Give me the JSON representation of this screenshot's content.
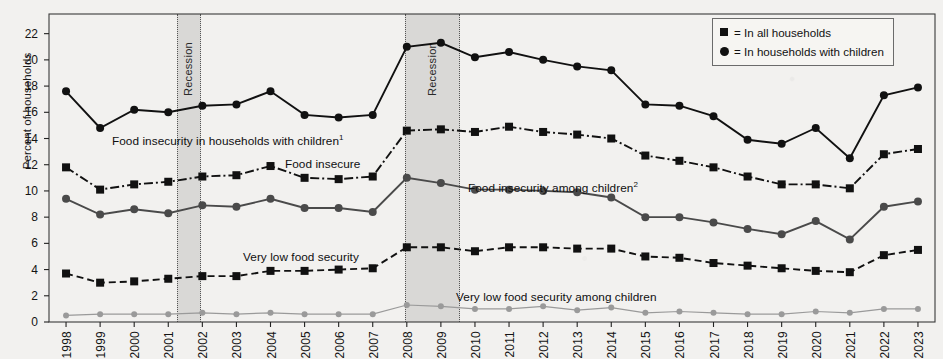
{
  "chart_data": {
    "type": "line",
    "title": "",
    "xlabel": "",
    "ylabel": "Percent of households",
    "ylim": [
      0,
      23.5
    ],
    "yticks": [
      0,
      2,
      4,
      6,
      8,
      10,
      12,
      14,
      16,
      18,
      20,
      22
    ],
    "grid": false,
    "legend_position": "top-right",
    "x": [
      1998,
      1999,
      2000,
      2001,
      2002,
      2003,
      2004,
      2005,
      2006,
      2007,
      2008,
      2009,
      2010,
      2011,
      2012,
      2013,
      2014,
      2015,
      2016,
      2017,
      2018,
      2019,
      2020,
      2021,
      2022,
      2023
    ],
    "xtick_labels": [
      "1998",
      "1999",
      "2000",
      "2001",
      "2002",
      "2003",
      "2004",
      "2005",
      "2006",
      "2007",
      "2008",
      "2009",
      "2010",
      "2011",
      "2012",
      "2013",
      "2014",
      "2015",
      "2016",
      "2017",
      "2018",
      "2019",
      "2020",
      "2021",
      "2022",
      "2023"
    ],
    "series": [
      {
        "name": "Food insecurity in households with children",
        "inline_label": "Food insecurity in households with children",
        "footnote": "1",
        "marker": "circle",
        "line_style": "solid",
        "color": "#111111",
        "values": [
          17.6,
          14.8,
          16.2,
          16.0,
          16.5,
          16.6,
          17.6,
          15.8,
          15.6,
          15.8,
          21.0,
          21.3,
          20.2,
          20.6,
          20.0,
          19.5,
          19.2,
          16.6,
          16.5,
          15.7,
          13.9,
          13.6,
          14.8,
          12.5,
          17.3,
          17.9
        ]
      },
      {
        "name": "Food insecure",
        "inline_label": "Food insecure",
        "footnote": "",
        "marker": "square",
        "line_style": "dash-dot",
        "color": "#111111",
        "values": [
          11.8,
          10.1,
          10.5,
          10.7,
          11.1,
          11.2,
          11.9,
          11.0,
          10.9,
          11.1,
          14.6,
          14.7,
          14.5,
          14.9,
          14.5,
          14.3,
          14.0,
          12.7,
          12.3,
          11.8,
          11.1,
          10.5,
          10.5,
          10.2,
          12.8,
          13.2
        ]
      },
      {
        "name": "Food insecurity among children",
        "inline_label": "Food insecurity among children",
        "footnote": "2",
        "marker": "circle",
        "line_style": "solid",
        "color": "#4a4a4a",
        "values": [
          9.4,
          8.2,
          8.6,
          8.3,
          8.9,
          8.8,
          9.4,
          8.7,
          8.7,
          8.4,
          11.0,
          10.6,
          10.1,
          10.1,
          10.0,
          9.9,
          9.5,
          8.0,
          8.0,
          7.6,
          7.1,
          6.7,
          7.7,
          6.3,
          8.8,
          9.2
        ]
      },
      {
        "name": "Very low food security",
        "inline_label": "Very low food security",
        "footnote": "",
        "marker": "square",
        "line_style": "dashed",
        "color": "#111111",
        "values": [
          3.7,
          3.0,
          3.1,
          3.3,
          3.5,
          3.5,
          3.9,
          3.9,
          4.0,
          4.1,
          5.7,
          5.7,
          5.4,
          5.7,
          5.7,
          5.6,
          5.6,
          5.0,
          4.9,
          4.5,
          4.3,
          4.1,
          3.9,
          3.8,
          5.1,
          5.5
        ]
      },
      {
        "name": "Very low food security among children",
        "inline_label": "Very low food security among children",
        "footnote": "",
        "marker": "circle",
        "line_style": "solid",
        "color": "#9a9a9a",
        "values": [
          0.5,
          0.6,
          0.6,
          0.6,
          0.7,
          0.6,
          0.7,
          0.6,
          0.6,
          0.6,
          1.3,
          1.2,
          1.0,
          1.0,
          1.2,
          0.9,
          1.1,
          0.7,
          0.8,
          0.7,
          0.6,
          0.6,
          0.8,
          0.7,
          1.0,
          1.0
        ]
      }
    ],
    "annotations": [
      {
        "label": "Recession",
        "start": 2001.25,
        "end": 2001.9
      },
      {
        "label": "Recession",
        "start": 2007.95,
        "end": 2009.5
      }
    ],
    "legend": [
      {
        "marker": "square",
        "text": "= In all households"
      },
      {
        "marker": "circle",
        "text": "= In households with children"
      }
    ]
  }
}
